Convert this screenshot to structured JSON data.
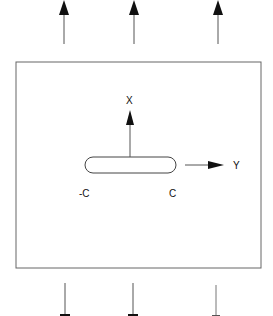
{
  "diagram": {
    "axis_labels": {
      "x": "X",
      "y": "Y"
    },
    "crack_tip_labels": {
      "left": "-C",
      "right": "C"
    },
    "top_arrows": {
      "count": 3,
      "direction": "up"
    },
    "bottom_arrows": {
      "count": 3,
      "direction": "down"
    },
    "colors": {
      "stroke": "#555555",
      "arrowhead": "#111111",
      "background": "#ffffff"
    }
  }
}
